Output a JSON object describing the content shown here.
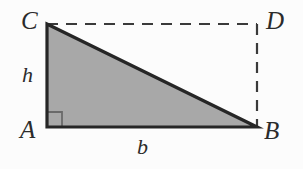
{
  "figure": {
    "kind": "right-triangle-in-rectangle-diagram",
    "width": 303,
    "height": 169,
    "background_color": "#fcfcfc",
    "stroke_color": "#262626",
    "fill_color": "#a8a8a8",
    "dash_color": "#3a3a3a"
  },
  "labels": {
    "vertex_top_left": "C",
    "vertex_top_right": "D",
    "vertex_bottom_left": "A",
    "vertex_bottom_right": "B",
    "side_height": "h",
    "side_base": "b"
  },
  "geometry": {
    "points": {
      "A": {
        "x": 47,
        "y": 127
      },
      "B": {
        "x": 257,
        "y": 127
      },
      "C": {
        "x": 47,
        "y": 24
      },
      "D": {
        "x": 257,
        "y": 24
      }
    },
    "solid_edges": [
      "A-C",
      "A-B",
      "C-B"
    ],
    "dashed_edges": [
      "C-D",
      "D-B"
    ],
    "filled_region": "triangle A-B-C",
    "right_angle_at": "A",
    "right_angle_marker_size": 15,
    "solid_stroke_width": 3.2,
    "dashed_stroke_width": 2.2,
    "dash_pattern": "11 8"
  }
}
